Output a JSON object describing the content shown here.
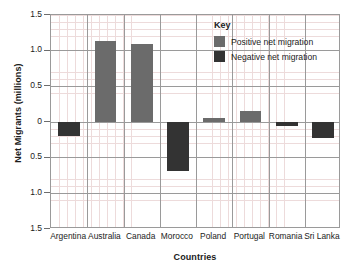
{
  "chart_data": {
    "type": "bar",
    "title": "",
    "xlabel": "Countries",
    "ylabel": "Net Migrants (millions)",
    "categories": [
      "Argentina",
      "Australia",
      "Canada",
      "Morocco",
      "Poland",
      "Portugal",
      "Romania",
      "Sri Lanka"
    ],
    "values": [
      -0.19,
      1.13,
      1.1,
      -0.69,
      0.06,
      0.15,
      -0.06,
      -0.23
    ],
    "ylim": [
      -1.5,
      1.5
    ],
    "ytick_values": [
      1.5,
      1.0,
      0.5,
      0,
      -0.5,
      -1.0,
      -1.5
    ],
    "ytick_labels": [
      "1.5",
      "1.0",
      "0.5",
      "0",
      "0.5",
      "1.0",
      "1.5"
    ],
    "grid": "major-and-minor",
    "minor_step": 0.05,
    "legend_position": "inside-top-right",
    "legend": {
      "title": "Key",
      "entries": [
        {
          "label": "Positive net migration",
          "color": "#6b6b6b"
        },
        {
          "label": "Negative net migration",
          "color": "#333333"
        }
      ]
    },
    "colors": {
      "positive": "#6b6b6b",
      "negative": "#333333",
      "grid_major": "#9a9a9a",
      "grid_minor": "#e7cfcf",
      "axis_text": "#1b1b1b"
    }
  }
}
